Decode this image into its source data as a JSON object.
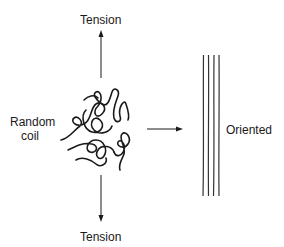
{
  "diagram": {
    "title": "",
    "labels": {
      "tension_top": "Tension",
      "tension_bottom": "Tension",
      "random_coil_line1": "Random",
      "random_coil_line2": "coil",
      "oriented": "Oriented"
    },
    "elements": [
      {
        "id": "arrow-up",
        "type": "arrow",
        "direction": "up"
      },
      {
        "id": "arrow-down",
        "type": "arrow",
        "direction": "down"
      },
      {
        "id": "arrow-right",
        "type": "arrow",
        "direction": "right"
      },
      {
        "id": "random-coil",
        "type": "tangled-chain"
      },
      {
        "id": "oriented-chains",
        "type": "parallel-lines",
        "count": 4
      }
    ],
    "colors": {
      "line": "#1a1a1a",
      "background": "#ffffff"
    }
  }
}
